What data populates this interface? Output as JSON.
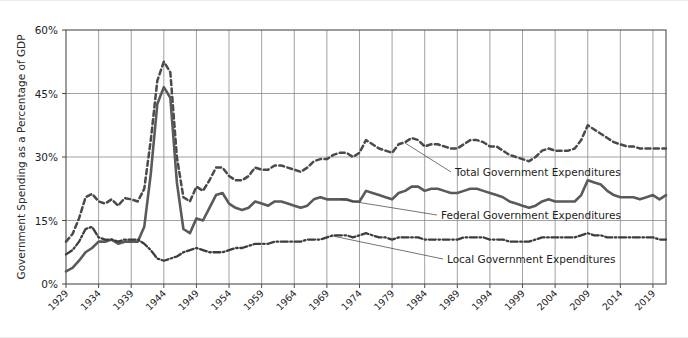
{
  "chart_data": {
    "type": "line",
    "title": "",
    "xlabel": "",
    "ylabel": "Government Spending as a Percentage of GDP",
    "ylim": [
      0,
      60
    ],
    "xlim": [
      1929,
      2021
    ],
    "yticks": [
      "0%",
      "15%",
      "30%",
      "45%",
      "60%"
    ],
    "ytick_values": [
      0,
      15,
      30,
      45,
      60
    ],
    "grid": true,
    "legend_position": "inline-annotations",
    "xtick_labels": [
      "1929",
      "1934",
      "1939",
      "1944",
      "1949",
      "1954",
      "1959",
      "1964",
      "1969",
      "1974",
      "1979",
      "1984",
      "1989",
      "1994",
      "1999",
      "2004",
      "2009",
      "2014",
      "2019"
    ],
    "xtick_values": [
      1929,
      1934,
      1939,
      1944,
      1949,
      1954,
      1959,
      1964,
      1969,
      1974,
      1979,
      1984,
      1989,
      1994,
      1999,
      2004,
      2009,
      2014,
      2019
    ],
    "x": [
      1929,
      1930,
      1931,
      1932,
      1933,
      1934,
      1935,
      1936,
      1937,
      1938,
      1939,
      1940,
      1941,
      1942,
      1943,
      1944,
      1945,
      1946,
      1947,
      1948,
      1949,
      1950,
      1951,
      1952,
      1953,
      1954,
      1955,
      1956,
      1957,
      1958,
      1959,
      1960,
      1961,
      1962,
      1963,
      1964,
      1965,
      1966,
      1967,
      1968,
      1969,
      1970,
      1971,
      1972,
      1973,
      1974,
      1975,
      1976,
      1977,
      1978,
      1979,
      1980,
      1981,
      1982,
      1983,
      1984,
      1985,
      1986,
      1987,
      1988,
      1989,
      1990,
      1991,
      1992,
      1993,
      1994,
      1995,
      1996,
      1997,
      1998,
      1999,
      2000,
      2001,
      2002,
      2003,
      2004,
      2005,
      2006,
      2007,
      2008,
      2009,
      2010,
      2011,
      2012,
      2013,
      2014,
      2015,
      2016,
      2017,
      2018,
      2019,
      2020,
      2021
    ],
    "series": [
      {
        "name": "Total Government Expenditures",
        "style": "dashed",
        "color": "#4a4a4a",
        "values": [
          10.0,
          11.8,
          15.5,
          20.5,
          21.3,
          19.5,
          19.0,
          20.0,
          18.5,
          20.3,
          20.0,
          19.5,
          22.5,
          34.0,
          48.0,
          52.5,
          50.0,
          30.0,
          20.5,
          19.5,
          23.0,
          22.0,
          24.5,
          27.5,
          27.5,
          25.5,
          24.5,
          24.5,
          25.5,
          27.5,
          27.0,
          27.0,
          28.0,
          28.0,
          27.5,
          27.0,
          26.5,
          27.5,
          29.0,
          29.5,
          29.5,
          30.5,
          31.0,
          31.0,
          30.0,
          31.0,
          34.0,
          33.0,
          32.0,
          31.5,
          31.0,
          33.0,
          33.5,
          34.5,
          34.0,
          32.5,
          33.0,
          33.0,
          32.5,
          32.0,
          32.0,
          33.0,
          34.0,
          34.0,
          33.5,
          32.5,
          32.5,
          31.5,
          30.5,
          30.0,
          29.5,
          29.0,
          30.0,
          31.5,
          32.0,
          31.5,
          31.5,
          31.5,
          32.0,
          34.0,
          37.5,
          36.5,
          35.5,
          34.5,
          33.5,
          33.0,
          32.5,
          32.5,
          32.0,
          32.0,
          32.0,
          32.0,
          32.0
        ]
      },
      {
        "name": "Federal Government Expenditures",
        "style": "solid",
        "color": "#5a5a5a",
        "values": [
          3.0,
          3.8,
          5.5,
          7.5,
          8.5,
          10.0,
          10.0,
          10.5,
          9.5,
          10.0,
          10.0,
          10.0,
          13.5,
          26.0,
          42.5,
          46.5,
          44.0,
          24.0,
          13.0,
          12.0,
          15.5,
          15.0,
          18.0,
          21.0,
          21.5,
          19.0,
          18.0,
          17.5,
          18.0,
          19.5,
          19.0,
          18.5,
          19.5,
          19.5,
          19.0,
          18.5,
          18.0,
          18.5,
          20.0,
          20.5,
          20.0,
          20.0,
          20.0,
          20.0,
          19.5,
          19.5,
          22.0,
          21.5,
          21.0,
          20.5,
          20.0,
          21.5,
          22.0,
          23.0,
          23.0,
          22.0,
          22.5,
          22.5,
          22.0,
          21.5,
          21.5,
          22.0,
          22.5,
          22.5,
          22.0,
          21.5,
          21.0,
          20.5,
          19.5,
          19.0,
          18.5,
          18.0,
          18.5,
          19.5,
          20.0,
          19.5,
          19.5,
          19.5,
          19.5,
          21.0,
          24.5,
          24.0,
          23.5,
          22.0,
          21.0,
          20.5,
          20.5,
          20.5,
          20.0,
          20.5,
          21.0,
          20.0,
          21.0
        ]
      },
      {
        "name": "Local Government Expenditures",
        "style": "dashdot",
        "color": "#3d3d3d",
        "values": [
          7.0,
          8.0,
          10.0,
          13.0,
          13.5,
          11.0,
          10.5,
          10.5,
          10.0,
          10.5,
          10.5,
          10.5,
          9.5,
          8.0,
          6.0,
          5.5,
          6.0,
          6.5,
          7.5,
          8.0,
          8.5,
          8.0,
          7.5,
          7.5,
          7.5,
          8.0,
          8.5,
          8.5,
          9.0,
          9.5,
          9.5,
          9.5,
          10.0,
          10.0,
          10.0,
          10.0,
          10.0,
          10.5,
          10.5,
          10.5,
          11.0,
          11.5,
          11.5,
          11.5,
          11.0,
          11.5,
          12.0,
          11.5,
          11.0,
          11.0,
          10.5,
          11.0,
          11.0,
          11.0,
          11.0,
          10.5,
          10.5,
          10.5,
          10.5,
          10.5,
          10.5,
          11.0,
          11.0,
          11.0,
          11.0,
          10.5,
          10.5,
          10.5,
          10.0,
          10.0,
          10.0,
          10.0,
          10.5,
          11.0,
          11.0,
          11.0,
          11.0,
          11.0,
          11.0,
          11.5,
          12.0,
          11.5,
          11.5,
          11.0,
          11.0,
          11.0,
          11.0,
          11.0,
          11.0,
          11.0,
          11.0,
          10.5,
          10.5
        ]
      }
    ],
    "annotations": [
      {
        "label": "Total Government Expenditures",
        "target_year": 1981,
        "target_value": 33.3
      },
      {
        "label": "Federal Government Expenditures",
        "target_year": 1971,
        "target_value": 20.0
      },
      {
        "label": "Local Government Expenditures",
        "target_year": 1970,
        "target_value": 11.3
      }
    ]
  }
}
